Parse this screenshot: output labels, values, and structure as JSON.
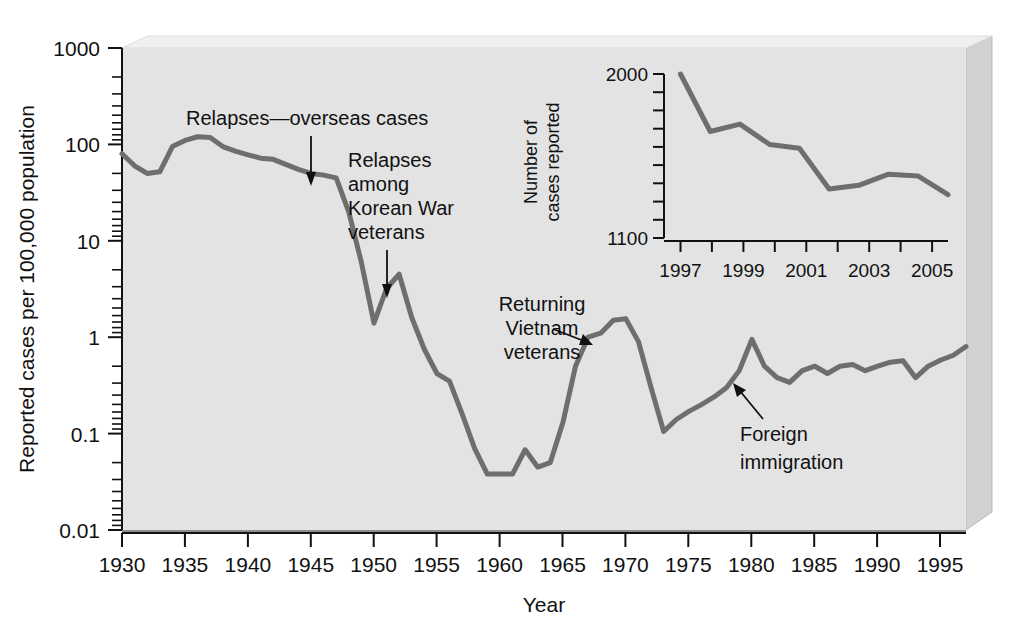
{
  "figure": {
    "background_color": "#ffffff",
    "plot_background_color": "#e3e3e3",
    "line_color": "#6e6e6e",
    "text_color": "#111111"
  },
  "chart_data": {
    "type": "line",
    "title": "",
    "xlabel": "Year",
    "ylabel": "Reported cases per 100,000 population",
    "yscale": "log",
    "ylim": [
      0.01,
      1000
    ],
    "xlim": [
      1930,
      1997
    ],
    "grid": false,
    "legend": "none",
    "ytick_labels": [
      "1000",
      "100",
      "10",
      "1",
      "0.1",
      "0.01"
    ],
    "ytick_values": [
      1000,
      100,
      10,
      1,
      0.1,
      0.01
    ],
    "xtick_labels": [
      "1930",
      "1935",
      "1940",
      "1945",
      "1950",
      "1955",
      "1960",
      "1965",
      "1970",
      "1975",
      "1980",
      "1985",
      "1990",
      "1995"
    ],
    "xtick_values": [
      1930,
      1935,
      1940,
      1945,
      1950,
      1955,
      1960,
      1965,
      1970,
      1975,
      1980,
      1985,
      1990,
      1995
    ],
    "x": [
      1930,
      1931,
      1932,
      1933,
      1934,
      1935,
      1936,
      1937,
      1938,
      1939,
      1940,
      1941,
      1942,
      1943,
      1944,
      1945,
      1946,
      1947,
      1948,
      1949,
      1950,
      1951,
      1952,
      1953,
      1954,
      1955,
      1956,
      1957,
      1958,
      1959,
      1960,
      1961,
      1962,
      1963,
      1964,
      1965,
      1966,
      1967,
      1968,
      1969,
      1970,
      1971,
      1972,
      1973,
      1974,
      1975,
      1976,
      1977,
      1978,
      1979,
      1980,
      1981,
      1982,
      1983,
      1984,
      1985,
      1986,
      1987,
      1988,
      1989,
      1990,
      1991,
      1992,
      1993,
      1994,
      1995,
      1996,
      1997
    ],
    "values": [
      80,
      60,
      50,
      52,
      95,
      110,
      120,
      118,
      95,
      85,
      78,
      72,
      70,
      62,
      55,
      50,
      48,
      45,
      20,
      6.0,
      1.4,
      3.2,
      4.5,
      1.6,
      0.75,
      0.42,
      0.35,
      0.16,
      0.07,
      0.038,
      0.038,
      0.038,
      0.068,
      0.045,
      0.05,
      0.13,
      0.5,
      1.0,
      1.1,
      1.5,
      1.55,
      0.9,
      0.3,
      0.105,
      0.14,
      0.17,
      0.2,
      0.24,
      0.3,
      0.45,
      0.95,
      0.5,
      0.38,
      0.34,
      0.45,
      0.5,
      0.42,
      0.5,
      0.52,
      0.45,
      0.5,
      0.55,
      0.57,
      0.38,
      0.5,
      0.58,
      0.65,
      0.8
    ],
    "annotations": [
      {
        "id": "relapses-overseas",
        "text": "Relapses—overseas cases",
        "points_to_year": 1945,
        "points_to_value": 50
      },
      {
        "id": "korean-war",
        "text_lines": [
          "Relapses",
          "among",
          "Korean War",
          "veterans"
        ],
        "points_to_year": 1951,
        "points_to_value": 3.2
      },
      {
        "id": "vietnam",
        "text_lines": [
          "Returning",
          "Vietnam",
          "veterans"
        ],
        "points_to_year": 1967,
        "points_to_value": 1.0
      },
      {
        "id": "foreign-immigration",
        "text_lines": [
          "Foreign",
          "immigration"
        ],
        "points_to_year": 1979,
        "points_to_value": 0.45
      }
    ],
    "inset": {
      "type": "line",
      "ylabel_lines": [
        "Number of",
        "cases reported"
      ],
      "xlabel": "",
      "ylim": [
        1100,
        2000
      ],
      "xlim": [
        1997,
        2006
      ],
      "yscale": "linear",
      "ytick_labels": [
        "2000",
        "1100"
      ],
      "ytick_values": [
        2000,
        1100
      ],
      "xtick_labels": [
        "1997",
        "1999",
        "2001",
        "2003",
        "2005"
      ],
      "xtick_values": [
        1997,
        1999,
        2001,
        2003,
        2005
      ],
      "x": [
        1997,
        1998,
        1999,
        2000,
        2001,
        2002,
        2003,
        2004,
        2005,
        2006
      ],
      "values": [
        2000,
        1690,
        1730,
        1620,
        1600,
        1380,
        1400,
        1460,
        1450,
        1350
      ]
    }
  }
}
